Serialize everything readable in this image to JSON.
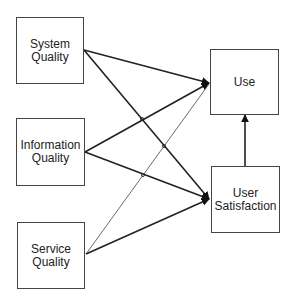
{
  "diagram": {
    "type": "model",
    "nodes": [
      {
        "id": "system_quality",
        "label_line1": "System",
        "label_line2": "Quality"
      },
      {
        "id": "information_quality",
        "label_line1": "Information",
        "label_line2": "Quality"
      },
      {
        "id": "service_quality",
        "label_line1": "Service",
        "label_line2": "Quality"
      },
      {
        "id": "use",
        "label_line1": "Use",
        "label_line2": ""
      },
      {
        "id": "user_satisfaction",
        "label_line1": "User",
        "label_line2": "Satisfaction"
      }
    ],
    "edges": [
      {
        "from": "system_quality",
        "to": "use",
        "weight": "thick"
      },
      {
        "from": "system_quality",
        "to": "user_satisfaction",
        "weight": "thick"
      },
      {
        "from": "information_quality",
        "to": "use",
        "weight": "thick"
      },
      {
        "from": "information_quality",
        "to": "user_satisfaction",
        "weight": "thick"
      },
      {
        "from": "service_quality",
        "to": "use",
        "weight": "thin"
      },
      {
        "from": "service_quality",
        "to": "user_satisfaction",
        "weight": "thick"
      },
      {
        "from": "user_satisfaction",
        "to": "use",
        "weight": "thick"
      }
    ],
    "colors": {
      "line": "#222222",
      "box_border": "#444444",
      "background": "#ffffff"
    }
  }
}
